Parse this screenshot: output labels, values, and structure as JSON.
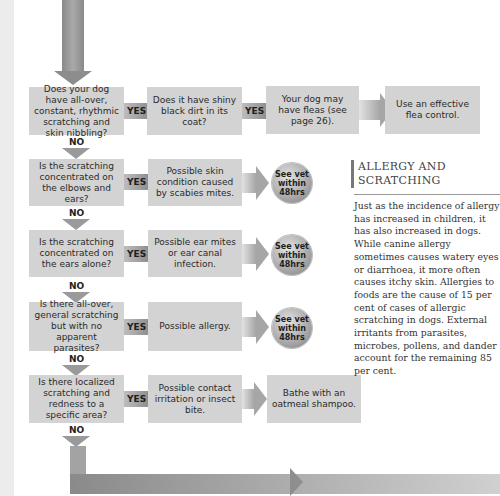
{
  "flowchart": {
    "rows": [
      {
        "question": "Does your dog have all-over, constant, rhythmic scratching and skin nibbling?",
        "yes_label": "YES",
        "no_label": "NO",
        "result": "Does it have shiny black dirt in its coat?",
        "result_yes_label": "YES",
        "followup": "Your dog may have fleas (see page 26).",
        "action": "Use an effective flea control."
      },
      {
        "question": "Is the scratching concentrated on the elbows and ears?",
        "yes_label": "YES",
        "no_label": "NO",
        "result": "Possible skin condition caused by scabies mites.",
        "badge": "See vet within 48hrs"
      },
      {
        "question": "Is the scratching concentrated on the ears alone?",
        "yes_label": "YES",
        "no_label": "NO",
        "result": "Possible ear mites or ear canal infection.",
        "badge": "See vet within 48hrs"
      },
      {
        "question": "Is there all-over, general scratching but with no apparent parasites?",
        "yes_label": "YES",
        "no_label": "NO",
        "result": "Possible allergy.",
        "badge": "See vet within 48hrs"
      },
      {
        "question": "Is there localized scratching and redness to a specific area?",
        "yes_label": "YES",
        "no_label": "NO",
        "result": "Possible contact irritation or insect bite.",
        "action": "Bathe with an oatmeal shampoo."
      }
    ],
    "badge_lines": [
      "See",
      "vet within",
      "48hrs"
    ]
  },
  "sidebar": {
    "title_line1": "ALLERGY AND",
    "title_line2": "SCRATCHING",
    "body": "Just as the incidence of allergy has increased in children, it has also increased in dogs. While canine allergy sometimes causes watery eyes or diarrhoea, it more often causes itchy skin. Allergies to foods are the cause of 15 per cent of cases of allergic scratching in dogs. External irritants from parasites, microbes, pollens, and dander account for the remaining 85 per cent."
  },
  "colors": {
    "box": "#d3d3d3",
    "arrow_dark": "#8d8d8d",
    "text": "#2a2a2a"
  }
}
